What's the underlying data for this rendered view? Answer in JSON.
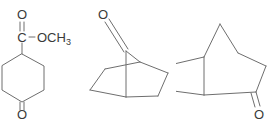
{
  "image": {
    "title": "Chemical structure set",
    "background_color": "#ffffff",
    "bond_color": "#6e6e6e",
    "label_color": "#3a3a3a",
    "width": 272,
    "height": 119
  },
  "structures": [
    {
      "id": "struct-1",
      "name": "methyl 4-oxocyclohexane-1-carboxylate",
      "skeleton": "cyclohexanone-ring",
      "labels": {
        "carbonyl_oxygen": "O",
        "ester_carbon": "C",
        "methoxy": "OCH",
        "methoxy_sub": "3",
        "ketone_oxygen": "O"
      }
    },
    {
      "id": "struct-2",
      "name": "bicyclo[2.2.1]heptan-7-one",
      "skeleton": "norbornane-bridged-bicyclic",
      "labels": {
        "ketone_oxygen": "O"
      }
    },
    {
      "id": "struct-3",
      "name": "bicyclo[2.2.1]heptan-2-one",
      "skeleton": "norbornane-bridged-bicyclic",
      "labels": {
        "ketone_oxygen": "O"
      }
    }
  ]
}
